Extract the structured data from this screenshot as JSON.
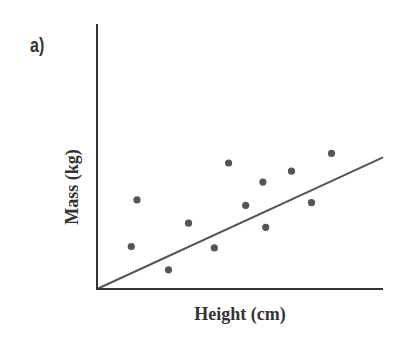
{
  "panel_label": "a)",
  "chart_data": {
    "type": "scatter",
    "title": "",
    "xlabel": "Height (cm)",
    "ylabel": "Mass (kg)",
    "grid": false,
    "legend": null,
    "ticks": "none",
    "xlim": [
      0,
      100
    ],
    "ylim": [
      0,
      100
    ],
    "points": [
      {
        "x": 12,
        "y": 31
      },
      {
        "x": 14,
        "y": 65
      },
      {
        "x": 25,
        "y": 14
      },
      {
        "x": 32,
        "y": 48
      },
      {
        "x": 41,
        "y": 30
      },
      {
        "x": 46,
        "y": 92
      },
      {
        "x": 52,
        "y": 61
      },
      {
        "x": 58,
        "y": 78
      },
      {
        "x": 59,
        "y": 45
      },
      {
        "x": 68,
        "y": 86
      },
      {
        "x": 75,
        "y": 63
      },
      {
        "x": 82,
        "y": 99
      }
    ],
    "trend_line": {
      "x0": 0,
      "y0": 0,
      "x1": 100,
      "y1": 99
    },
    "point_color": "#555555",
    "axis_color": "#333333"
  }
}
